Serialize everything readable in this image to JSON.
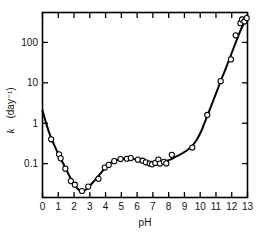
{
  "chart_data": {
    "type": "scatter",
    "title": "",
    "subtitle": "",
    "xlabel": "pH",
    "ylabel": "k (day⁻¹)",
    "ylabel_symbol": "k",
    "ylabel_units": "(day⁻¹)",
    "xscale": "linear",
    "yscale": "log",
    "xlim": [
      0,
      13
    ],
    "ylim": [
      0.0145,
      550
    ],
    "grid": false,
    "legend": null,
    "legend_position": "none",
    "xticks": [
      0,
      1,
      2,
      3,
      4,
      5,
      6,
      7,
      8,
      9,
      10,
      11,
      12,
      13
    ],
    "xtick_labels": [
      "0",
      "1",
      "2",
      "3",
      "4",
      "5",
      "6",
      "7",
      "8",
      "9",
      "10",
      "11",
      "12",
      "13"
    ],
    "yticks": [
      0.1,
      1,
      10,
      100
    ],
    "ytick_labels": [
      "0.1",
      "1",
      "10",
      "100"
    ],
    "tick_direction": "in",
    "frame": "box",
    "marker": "open-circle",
    "marker_color": "#ffffff",
    "marker_edge_color": "#000000",
    "line_color": "#000000",
    "series": [
      {
        "name": "rate constant",
        "marker": "open-circle",
        "points": [
          {
            "x": 0.55,
            "y": 0.4
          },
          {
            "x": 1.05,
            "y": 0.17
          },
          {
            "x": 1.15,
            "y": 0.135
          },
          {
            "x": 1.45,
            "y": 0.075
          },
          {
            "x": 1.8,
            "y": 0.037
          },
          {
            "x": 2.05,
            "y": 0.03
          },
          {
            "x": 2.5,
            "y": 0.021
          },
          {
            "x": 2.9,
            "y": 0.027
          },
          {
            "x": 3.55,
            "y": 0.042
          },
          {
            "x": 3.95,
            "y": 0.08
          },
          {
            "x": 4.2,
            "y": 0.093
          },
          {
            "x": 4.55,
            "y": 0.115
          },
          {
            "x": 4.95,
            "y": 0.13
          },
          {
            "x": 5.35,
            "y": 0.132
          },
          {
            "x": 5.6,
            "y": 0.137
          },
          {
            "x": 6.05,
            "y": 0.125
          },
          {
            "x": 6.35,
            "y": 0.118
          },
          {
            "x": 6.55,
            "y": 0.108
          },
          {
            "x": 6.8,
            "y": 0.1
          },
          {
            "x": 6.95,
            "y": 0.096
          },
          {
            "x": 7.15,
            "y": 0.104
          },
          {
            "x": 7.35,
            "y": 0.125
          },
          {
            "x": 7.45,
            "y": 0.1
          },
          {
            "x": 7.7,
            "y": 0.11
          },
          {
            "x": 7.85,
            "y": 0.101
          },
          {
            "x": 8.2,
            "y": 0.165
          },
          {
            "x": 9.5,
            "y": 0.25
          },
          {
            "x": 10.45,
            "y": 1.6
          },
          {
            "x": 11.3,
            "y": 11.0
          },
          {
            "x": 11.95,
            "y": 38.0
          },
          {
            "x": 12.25,
            "y": 150.0
          },
          {
            "x": 12.55,
            "y": 300.0
          },
          {
            "x": 12.65,
            "y": 370.0
          },
          {
            "x": 12.8,
            "y": 330.0
          },
          {
            "x": 12.95,
            "y": 400.0
          }
        ]
      }
    ],
    "fit_curve": {
      "name": "fitted rate profile",
      "points": [
        {
          "x": 0.0,
          "y": 2.05
        },
        {
          "x": 0.2,
          "y": 1.1
        },
        {
          "x": 0.4,
          "y": 0.62
        },
        {
          "x": 0.6,
          "y": 0.385
        },
        {
          "x": 0.8,
          "y": 0.255
        },
        {
          "x": 1.0,
          "y": 0.175
        },
        {
          "x": 1.2,
          "y": 0.123
        },
        {
          "x": 1.4,
          "y": 0.086
        },
        {
          "x": 1.6,
          "y": 0.06
        },
        {
          "x": 1.8,
          "y": 0.042
        },
        {
          "x": 2.0,
          "y": 0.031
        },
        {
          "x": 2.2,
          "y": 0.0245
        },
        {
          "x": 2.4,
          "y": 0.0212
        },
        {
          "x": 2.6,
          "y": 0.0208
        },
        {
          "x": 2.8,
          "y": 0.0235
        },
        {
          "x": 3.0,
          "y": 0.0285
        },
        {
          "x": 3.2,
          "y": 0.0345
        },
        {
          "x": 3.4,
          "y": 0.0425
        },
        {
          "x": 3.6,
          "y": 0.0525
        },
        {
          "x": 3.8,
          "y": 0.0655
        },
        {
          "x": 4.0,
          "y": 0.082
        },
        {
          "x": 4.2,
          "y": 0.0975
        },
        {
          "x": 4.4,
          "y": 0.11
        },
        {
          "x": 4.6,
          "y": 0.119
        },
        {
          "x": 4.8,
          "y": 0.126
        },
        {
          "x": 5.0,
          "y": 0.13
        },
        {
          "x": 5.3,
          "y": 0.133
        },
        {
          "x": 5.6,
          "y": 0.133
        },
        {
          "x": 5.9,
          "y": 0.128
        },
        {
          "x": 6.2,
          "y": 0.121
        },
        {
          "x": 6.5,
          "y": 0.114
        },
        {
          "x": 6.8,
          "y": 0.11
        },
        {
          "x": 7.1,
          "y": 0.108
        },
        {
          "x": 7.4,
          "y": 0.109
        },
        {
          "x": 7.7,
          "y": 0.113
        },
        {
          "x": 8.0,
          "y": 0.122
        },
        {
          "x": 8.3,
          "y": 0.137
        },
        {
          "x": 8.6,
          "y": 0.158
        },
        {
          "x": 8.9,
          "y": 0.183
        },
        {
          "x": 9.2,
          "y": 0.218
        },
        {
          "x": 9.5,
          "y": 0.275
        },
        {
          "x": 9.8,
          "y": 0.4
        },
        {
          "x": 10.1,
          "y": 0.68
        },
        {
          "x": 10.4,
          "y": 1.35
        },
        {
          "x": 10.7,
          "y": 2.7
        },
        {
          "x": 11.0,
          "y": 5.4
        },
        {
          "x": 11.3,
          "y": 11.0
        },
        {
          "x": 11.6,
          "y": 21.5
        },
        {
          "x": 11.9,
          "y": 43.0
        },
        {
          "x": 12.2,
          "y": 88.0
        },
        {
          "x": 12.5,
          "y": 175.0
        },
        {
          "x": 12.75,
          "y": 285.0
        },
        {
          "x": 13.0,
          "y": 430.0
        }
      ]
    }
  }
}
